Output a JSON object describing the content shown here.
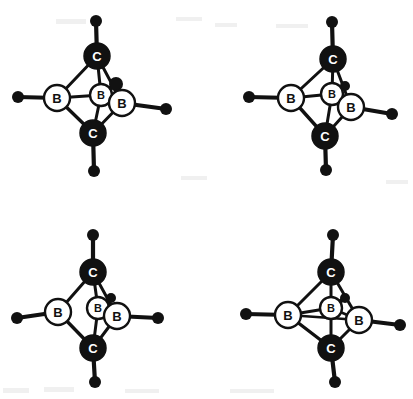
{
  "figure": {
    "background_color": "#ffffff",
    "bond_color": "#111111",
    "carbon_fill": "#111111",
    "carbon_label_color": "#ffffff",
    "boron_fill": "#ffffff",
    "boron_label_color": "#111111",
    "terminal_fill": "#111111",
    "atom_labels": {
      "carbon": "C",
      "boron": "B"
    },
    "panel_count": 4
  },
  "panels": [
    {
      "id": "panel-top-left",
      "name": "structure-top-left",
      "origin": [
        0,
        0
      ],
      "atoms": [
        {
          "id": "C-top",
          "element": "C",
          "label": "C",
          "x": 97,
          "y": 56,
          "r": 13,
          "type": "carbon"
        },
        {
          "id": "C-bottom",
          "element": "C",
          "label": "C",
          "x": 93,
          "y": 133,
          "r": 13,
          "type": "carbon"
        },
        {
          "id": "B-left",
          "element": "B",
          "label": "B",
          "x": 57,
          "y": 98,
          "r": 13,
          "type": "boron"
        },
        {
          "id": "B-right",
          "element": "B",
          "label": "B",
          "x": 122,
          "y": 103,
          "r": 13,
          "type": "boron"
        },
        {
          "id": "B-center",
          "element": "B",
          "label": "B",
          "x": 101,
          "y": 95,
          "r": 11,
          "type": "boron"
        }
      ],
      "terminals": [
        {
          "id": "H-top",
          "x": 96,
          "y": 21,
          "r": 6,
          "bond_from": "C-top"
        },
        {
          "id": "H-bottom",
          "x": 94,
          "y": 171,
          "r": 6,
          "bond_from": "C-bottom"
        },
        {
          "id": "H-left",
          "x": 18,
          "y": 97,
          "r": 6,
          "bond_from": "B-left"
        },
        {
          "id": "H-right",
          "x": 166,
          "y": 109,
          "r": 6,
          "bond_from": "B-right"
        },
        {
          "id": "H-center",
          "x": 116,
          "y": 84,
          "r": 7,
          "bond_from": "B-center"
        }
      ],
      "bonds": [
        {
          "from": "C-top",
          "to": "B-left",
          "width": 3.0
        },
        {
          "from": "C-top",
          "to": "B-right",
          "width": 3.0
        },
        {
          "from": "C-top",
          "to": "B-center",
          "width": 3.0
        },
        {
          "from": "C-bottom",
          "to": "B-left",
          "width": 3.4
        },
        {
          "from": "C-bottom",
          "to": "B-right",
          "width": 3.0
        },
        {
          "from": "C-bottom",
          "to": "B-center",
          "width": 3.0
        },
        {
          "from": "B-left",
          "to": "B-center",
          "width": 2.8
        },
        {
          "from": "B-center",
          "to": "B-right",
          "width": 2.8
        }
      ]
    },
    {
      "id": "panel-top-right",
      "name": "structure-top-right",
      "origin": [
        206,
        0
      ],
      "atoms": [
        {
          "id": "C-top",
          "element": "C",
          "label": "C",
          "x": 333,
          "y": 59,
          "r": 13,
          "type": "carbon"
        },
        {
          "id": "C-bottom",
          "element": "C",
          "label": "C",
          "x": 325,
          "y": 136,
          "r": 13,
          "type": "carbon"
        },
        {
          "id": "B-left",
          "element": "B",
          "label": "B",
          "x": 291,
          "y": 98,
          "r": 13,
          "type": "boron"
        },
        {
          "id": "B-right",
          "element": "B",
          "label": "B",
          "x": 351,
          "y": 107,
          "r": 13,
          "type": "boron"
        },
        {
          "id": "B-center",
          "element": "B",
          "label": "B",
          "x": 332,
          "y": 94,
          "r": 11,
          "type": "boron"
        }
      ],
      "terminals": [
        {
          "id": "H-top",
          "x": 332,
          "y": 22,
          "r": 6,
          "bond_from": "C-top"
        },
        {
          "id": "H-bottom",
          "x": 326,
          "y": 170,
          "r": 6,
          "bond_from": "C-bottom"
        },
        {
          "id": "H-left",
          "x": 249,
          "y": 97,
          "r": 6,
          "bond_from": "B-left"
        },
        {
          "id": "H-right",
          "x": 392,
          "y": 114,
          "r": 6,
          "bond_from": "B-right"
        },
        {
          "id": "H-center",
          "x": 345,
          "y": 86,
          "r": 5,
          "bond_from": "B-center"
        }
      ],
      "bonds": [
        {
          "from": "C-top",
          "to": "B-left",
          "width": 3.0
        },
        {
          "from": "C-top",
          "to": "B-right",
          "width": 3.0
        },
        {
          "from": "C-top",
          "to": "B-center",
          "width": 3.0
        },
        {
          "from": "C-bottom",
          "to": "B-left",
          "width": 3.4
        },
        {
          "from": "C-bottom",
          "to": "B-right",
          "width": 3.0
        },
        {
          "from": "C-bottom",
          "to": "B-center",
          "width": 3.0
        },
        {
          "from": "B-left",
          "to": "B-center",
          "width": 2.8
        },
        {
          "from": "B-center",
          "to": "B-right",
          "width": 2.8
        }
      ]
    },
    {
      "id": "panel-bottom-left",
      "name": "structure-bottom-left",
      "origin": [
        0,
        200
      ],
      "atoms": [
        {
          "id": "C-top",
          "element": "C",
          "label": "C",
          "x": 93,
          "y": 272,
          "r": 13,
          "type": "carbon"
        },
        {
          "id": "C-bottom",
          "element": "C",
          "label": "C",
          "x": 93,
          "y": 348,
          "r": 13,
          "type": "carbon"
        },
        {
          "id": "B-left",
          "element": "B",
          "label": "B",
          "x": 58,
          "y": 312,
          "r": 13,
          "type": "boron"
        },
        {
          "id": "B-right",
          "element": "B",
          "label": "B",
          "x": 117,
          "y": 316,
          "r": 13,
          "type": "boron"
        },
        {
          "id": "B-center",
          "element": "B",
          "label": "B",
          "x": 98,
          "y": 308,
          "r": 11,
          "type": "boron"
        }
      ],
      "terminals": [
        {
          "id": "H-top",
          "x": 93,
          "y": 235,
          "r": 6,
          "bond_from": "C-top"
        },
        {
          "id": "H-bottom",
          "x": 95,
          "y": 382,
          "r": 6,
          "bond_from": "C-bottom"
        },
        {
          "id": "H-left",
          "x": 17,
          "y": 318,
          "r": 6,
          "bond_from": "B-left"
        },
        {
          "id": "H-right",
          "x": 158,
          "y": 318,
          "r": 6,
          "bond_from": "B-right"
        },
        {
          "id": "H-center",
          "x": 111,
          "y": 298,
          "r": 5,
          "bond_from": "B-center"
        }
      ],
      "bonds": [
        {
          "from": "C-top",
          "to": "B-left",
          "width": 3.0
        },
        {
          "from": "C-top",
          "to": "B-right",
          "width": 3.0
        },
        {
          "from": "C-top",
          "to": "B-center",
          "width": 3.0
        },
        {
          "from": "C-bottom",
          "to": "B-left",
          "width": 3.4
        },
        {
          "from": "C-bottom",
          "to": "B-right",
          "width": 3.0
        },
        {
          "from": "C-bottom",
          "to": "B-center",
          "width": 3.0
        },
        {
          "from": "B-center",
          "to": "B-right",
          "width": 2.4
        }
      ]
    },
    {
      "id": "panel-bottom-right",
      "name": "structure-bottom-right",
      "origin": [
        206,
        200
      ],
      "atoms": [
        {
          "id": "C-top",
          "element": "C",
          "label": "C",
          "x": 331,
          "y": 272,
          "r": 13,
          "type": "carbon"
        },
        {
          "id": "C-bottom",
          "element": "C",
          "label": "C",
          "x": 331,
          "y": 348,
          "r": 13,
          "type": "carbon"
        },
        {
          "id": "B-left",
          "element": "B",
          "label": "B",
          "x": 288,
          "y": 315,
          "r": 13,
          "type": "boron"
        },
        {
          "id": "B-right",
          "element": "B",
          "label": "B",
          "x": 359,
          "y": 320,
          "r": 13,
          "type": "boron"
        },
        {
          "id": "B-center",
          "element": "B",
          "label": "B",
          "x": 331,
          "y": 308,
          "r": 11,
          "type": "boron"
        }
      ],
      "terminals": [
        {
          "id": "H-top",
          "x": 333,
          "y": 235,
          "r": 6,
          "bond_from": "C-top"
        },
        {
          "id": "H-bottom",
          "x": 335,
          "y": 382,
          "r": 6,
          "bond_from": "C-bottom"
        },
        {
          "id": "H-left",
          "x": 246,
          "y": 314,
          "r": 6,
          "bond_from": "B-left"
        },
        {
          "id": "H-right",
          "x": 400,
          "y": 325,
          "r": 6,
          "bond_from": "B-right"
        },
        {
          "id": "H-center",
          "x": 345,
          "y": 298,
          "r": 5,
          "bond_from": "B-center"
        }
      ],
      "bonds": [
        {
          "from": "C-top",
          "to": "B-left",
          "width": 3.0
        },
        {
          "from": "C-top",
          "to": "B-right",
          "width": 3.0
        },
        {
          "from": "C-top",
          "to": "B-center",
          "width": 3.0
        },
        {
          "from": "C-bottom",
          "to": "B-left",
          "width": 3.4
        },
        {
          "from": "C-bottom",
          "to": "B-right",
          "width": 3.0
        },
        {
          "from": "C-bottom",
          "to": "B-center",
          "width": 3.0
        },
        {
          "from": "B-left",
          "to": "B-center",
          "width": 2.8
        },
        {
          "from": "B-left",
          "to": "B-right",
          "width": 2.6
        },
        {
          "from": "B-center",
          "to": "B-right",
          "width": 2.6
        }
      ]
    }
  ],
  "artifacts": [
    {
      "x": 3,
      "y": 388,
      "w": 26,
      "h": 5
    },
    {
      "x": 44,
      "y": 387,
      "w": 30,
      "h": 5
    },
    {
      "x": 125,
      "y": 389,
      "w": 34,
      "h": 4
    },
    {
      "x": 230,
      "y": 389,
      "w": 44,
      "h": 4
    },
    {
      "x": 56,
      "y": 19,
      "w": 30,
      "h": 5
    },
    {
      "x": 176,
      "y": 17,
      "w": 26,
      "h": 4
    },
    {
      "x": 215,
      "y": 23,
      "w": 22,
      "h": 4
    },
    {
      "x": 276,
      "y": 24,
      "w": 32,
      "h": 4
    },
    {
      "x": 181,
      "y": 176,
      "w": 26,
      "h": 4
    },
    {
      "x": 386,
      "y": 180,
      "w": 22,
      "h": 4
    }
  ]
}
